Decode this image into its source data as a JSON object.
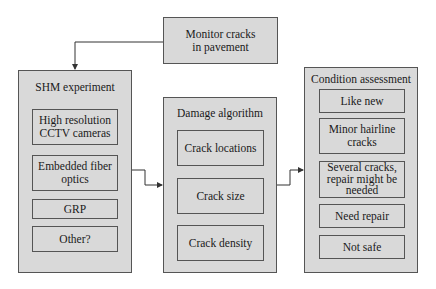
{
  "diagram": {
    "start": {
      "label": "Monitor cracks in pavement",
      "lines": [
        "Monitor cracks",
        "in pavement"
      ]
    },
    "shm": {
      "title": "SHM experiment",
      "items": [
        {
          "lines": [
            "High resolution",
            "CCTV cameras"
          ]
        },
        {
          "lines": [
            "Embedded fiber",
            "optics"
          ]
        },
        {
          "lines": [
            "GRP"
          ]
        },
        {
          "lines": [
            "Other?"
          ]
        }
      ]
    },
    "damage": {
      "title": "Damage algorithm",
      "items": [
        {
          "lines": [
            "Crack locations"
          ]
        },
        {
          "lines": [
            "Crack size"
          ]
        },
        {
          "lines": [
            "Crack density"
          ]
        }
      ]
    },
    "condition": {
      "title": "Condition assessment",
      "items": [
        {
          "lines": [
            "Like new"
          ]
        },
        {
          "lines": [
            "Minor hairline",
            "cracks"
          ]
        },
        {
          "lines": [
            "Several cracks,",
            "repair might be",
            "needed"
          ]
        },
        {
          "lines": [
            "Need repair"
          ]
        },
        {
          "lines": [
            "Not safe"
          ]
        }
      ]
    },
    "edges": [
      {
        "from": "Monitor cracks in pavement",
        "to": "SHM experiment"
      },
      {
        "from": "SHM experiment",
        "to": "Damage algorithm"
      },
      {
        "from": "Damage algorithm",
        "to": "Condition assessment"
      }
    ],
    "colors": {
      "box_fill": "#d9d9d9",
      "border": "#555555",
      "line": "#333333"
    }
  }
}
